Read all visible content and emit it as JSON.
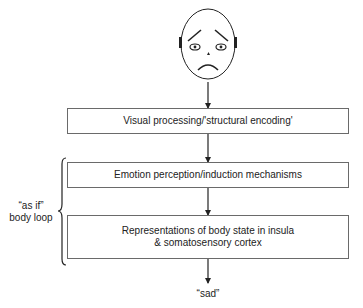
{
  "diagram": {
    "stimulus": {
      "icon": "sad-face-icon",
      "description": "sad face"
    },
    "boxes": [
      {
        "label": "Visual processing/'structural encoding'"
      },
      {
        "label": "Emotion perception/induction mechanisms"
      },
      {
        "label": "Representations of body state in insula & somatosensory cortex"
      }
    ],
    "loop_label_line1": "“as if”",
    "loop_label_line2": "body loop",
    "output_label": "“sad”"
  }
}
